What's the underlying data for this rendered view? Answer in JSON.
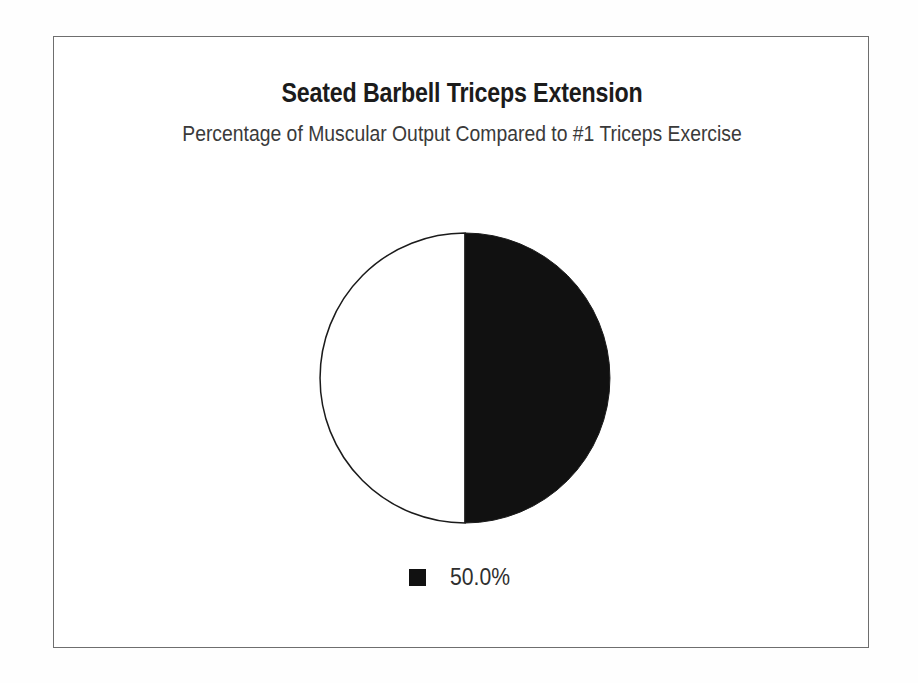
{
  "figure": {
    "title": "Seated Barbell Triceps Extension",
    "subtitle": "Percentage of Muscular Output Compared to #1 Triceps Exercise",
    "frame_color": "#6e6e6e",
    "background_color": "#ffffff"
  },
  "legend": {
    "position": "bottom-center",
    "entries": [
      {
        "label": "50.0%",
        "color": "#111111",
        "swatch": "filled-square"
      }
    ]
  },
  "chart_data": {
    "type": "pie",
    "title": "Seated Barbell Triceps Extension",
    "subtitle": "Percentage of Muscular Output Compared to #1 Triceps Exercise",
    "xlabel": "",
    "ylabel": "",
    "grid": false,
    "legend_position": "bottom-center",
    "start_angle_deg": 0,
    "direction": "clockwise",
    "categories": [
      "50.0%",
      ""
    ],
    "values": [
      50.0,
      50.0
    ],
    "labels": [
      "50.0%",
      ""
    ],
    "colors": [
      "#111111",
      "#ffffff"
    ],
    "slices": [
      {
        "label": "50.0%",
        "value": 50.0,
        "percent": "50.0%",
        "fill": "#111111",
        "stroke": "#1b1b1b",
        "half": "right"
      },
      {
        "label": "",
        "value": 50.0,
        "percent": "50.0%",
        "fill": "#ffffff",
        "stroke": "#1b1b1b",
        "half": "left"
      }
    ],
    "annotations": []
  }
}
